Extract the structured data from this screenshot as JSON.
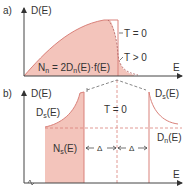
{
  "colors": {
    "fill": "#f3c4bb",
    "edge": "#d9817a",
    "axis": "#444444",
    "text": "#333333"
  },
  "panel_a": {
    "label": "a)",
    "y_axis_label": "D(E)",
    "x_axis_label": "E",
    "curve_label_t0": "T = 0",
    "curve_label_tpos": "T > 0",
    "formula": "Nn = 2Dn(E)·f(E)",
    "formula_main": "N",
    "formula_sub": "n",
    "formula_rest": " = 2D",
    "formula_sub2": "n",
    "formula_tail": "(E)·f(E)"
  },
  "panel_b": {
    "label": "b)",
    "y_axis_label": "D(E)",
    "x_axis_label": "E",
    "temp_label": "T = 0",
    "ds_left_main": "D",
    "ds_left_sub": "s",
    "ds_left_tail": "(E)",
    "ds_right_main": "D",
    "ds_right_sub": "s",
    "ds_right_tail": "(E)",
    "dn_main": "D",
    "dn_sub": "n",
    "dn_tail": "(E)",
    "ns_main": "N",
    "ns_sub": "s",
    "ns_tail": "(E)",
    "gap_left": "Δ",
    "gap_right": "Δ"
  }
}
